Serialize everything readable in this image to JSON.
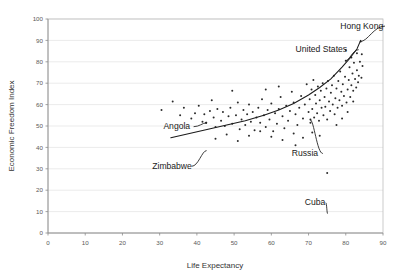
{
  "chart_data": {
    "type": "scatter",
    "title": "",
    "xlabel": "Life Expectancy",
    "ylabel": "Economic Freedom Index",
    "xlim": [
      0,
      90
    ],
    "ylim": [
      0,
      100
    ],
    "xticks": [
      0,
      10,
      20,
      30,
      40,
      50,
      60,
      70,
      80,
      90
    ],
    "yticks": [
      0,
      10,
      20,
      30,
      40,
      50,
      60,
      70,
      80,
      90,
      100
    ],
    "grid": true,
    "legend": null,
    "point_color": "#2b2b2b",
    "curve_color": "#1a1a1a",
    "grid_color": "#e2e2e2",
    "trend": {
      "label": "fitted exponential trend curve",
      "x": [
        33,
        38,
        43,
        48,
        53,
        58,
        62,
        66,
        70,
        73,
        76,
        79,
        81,
        83,
        84
      ],
      "y": [
        44.5,
        46.5,
        48.5,
        50.5,
        52.5,
        55,
        57.5,
        60.5,
        64.5,
        68,
        72,
        77.5,
        81.5,
        86,
        90
      ]
    },
    "annotations": [
      {
        "text": "Hong Kong",
        "x": 78.5,
        "y": 95.5,
        "leader_to_x": 84.0,
        "leader_to_y": 89.5
      },
      {
        "text": "United States",
        "x": 66.5,
        "y": 84.5,
        "leader_to_x": 80.0,
        "leader_to_y": 80.5
      },
      {
        "text": "Angola",
        "x": 31.0,
        "y": 48.5,
        "leader_to_x": 42.5,
        "leader_to_y": 51.5
      },
      {
        "text": "Russia",
        "x": 65.5,
        "y": 36.0,
        "leader_to_x": 70.5,
        "leader_to_y": 53.0
      },
      {
        "text": "Zimbabwe",
        "x": 28.0,
        "y": 30.0,
        "leader_to_x": 42.5,
        "leader_to_y": 38.5
      },
      {
        "text": "Cuba",
        "x": 69.0,
        "y": 13.0,
        "leader_to_x": 75.0,
        "leader_to_y": 9.0
      }
    ],
    "points": [
      [
        30.5,
        57.5
      ],
      [
        33.5,
        61.5
      ],
      [
        35.5,
        55.0
      ],
      [
        36.5,
        58.5
      ],
      [
        38.5,
        53.5
      ],
      [
        39.5,
        56.0
      ],
      [
        40.5,
        59.5
      ],
      [
        41.5,
        52.0
      ],
      [
        42.0,
        55.5
      ],
      [
        42.5,
        51.5
      ],
      [
        43.5,
        57.0
      ],
      [
        44.5,
        54.0
      ],
      [
        45.0,
        49.5
      ],
      [
        45.5,
        58.0
      ],
      [
        46.5,
        52.5
      ],
      [
        47.0,
        56.5
      ],
      [
        47.5,
        50.0
      ],
      [
        48.5,
        54.5
      ],
      [
        49.0,
        58.5
      ],
      [
        49.5,
        51.0
      ],
      [
        50.5,
        55.0
      ],
      [
        51.0,
        61.0
      ],
      [
        51.5,
        48.5
      ],
      [
        52.0,
        53.0
      ],
      [
        52.5,
        57.5
      ],
      [
        53.0,
        50.5
      ],
      [
        53.5,
        55.5
      ],
      [
        54.0,
        60.0
      ],
      [
        54.5,
        52.0
      ],
      [
        55.0,
        56.5
      ],
      [
        55.5,
        48.0
      ],
      [
        56.0,
        54.0
      ],
      [
        56.5,
        58.5
      ],
      [
        57.0,
        51.5
      ],
      [
        57.5,
        62.5
      ],
      [
        58.0,
        55.0
      ],
      [
        58.5,
        49.5
      ],
      [
        59.0,
        57.5
      ],
      [
        59.5,
        53.0
      ],
      [
        60.0,
        60.5
      ],
      [
        60.5,
        47.5
      ],
      [
        61.0,
        56.0
      ],
      [
        61.5,
        51.0
      ],
      [
        62.0,
        58.0
      ],
      [
        62.5,
        63.5
      ],
      [
        63.0,
        54.5
      ],
      [
        63.5,
        49.0
      ],
      [
        64.0,
        59.5
      ],
      [
        64.5,
        52.5
      ],
      [
        65.0,
        57.0
      ],
      [
        65.5,
        66.0
      ],
      [
        66.0,
        61.0
      ],
      [
        66.5,
        55.5
      ],
      [
        67.0,
        50.5
      ],
      [
        67.5,
        58.5
      ],
      [
        68.0,
        64.0
      ],
      [
        68.5,
        53.5
      ],
      [
        69.0,
        60.0
      ],
      [
        69.5,
        69.5
      ],
      [
        70.0,
        56.5
      ],
      [
        70.3,
        62.5
      ],
      [
        70.5,
        51.5
      ],
      [
        70.8,
        67.0
      ],
      [
        71.0,
        58.0
      ],
      [
        71.3,
        71.5
      ],
      [
        71.5,
        54.0
      ],
      [
        71.8,
        64.5
      ],
      [
        72.0,
        60.5
      ],
      [
        72.3,
        56.0
      ],
      [
        72.5,
        68.5
      ],
      [
        72.8,
        52.5
      ],
      [
        73.0,
        62.0
      ],
      [
        73.3,
        66.5
      ],
      [
        73.5,
        58.5
      ],
      [
        73.8,
        70.0
      ],
      [
        74.0,
        55.0
      ],
      [
        74.3,
        63.5
      ],
      [
        74.5,
        59.0
      ],
      [
        74.8,
        67.5
      ],
      [
        75.0,
        53.0
      ],
      [
        75.2,
        71.0
      ],
      [
        75.5,
        61.5
      ],
      [
        75.8,
        57.0
      ],
      [
        76.0,
        65.5
      ],
      [
        76.3,
        69.0
      ],
      [
        76.5,
        60.0
      ],
      [
        76.8,
        73.5
      ],
      [
        77.0,
        55.5
      ],
      [
        77.2,
        63.0
      ],
      [
        77.5,
        67.5
      ],
      [
        77.8,
        58.5
      ],
      [
        78.0,
        71.0
      ],
      [
        78.3,
        62.0
      ],
      [
        78.5,
        75.5
      ],
      [
        78.8,
        66.0
      ],
      [
        79.0,
        59.5
      ],
      [
        79.2,
        69.5
      ],
      [
        79.5,
        64.0
      ],
      [
        79.8,
        73.0
      ],
      [
        80.0,
        80.5
      ],
      [
        80.2,
        61.0
      ],
      [
        80.5,
        67.0
      ],
      [
        80.8,
        71.5
      ],
      [
        81.0,
        77.5
      ],
      [
        81.2,
        63.5
      ],
      [
        81.5,
        69.0
      ],
      [
        81.8,
        74.5
      ],
      [
        82.0,
        66.5
      ],
      [
        82.2,
        79.5
      ],
      [
        82.5,
        72.0
      ],
      [
        82.8,
        68.0
      ],
      [
        83.0,
        76.0
      ],
      [
        83.3,
        70.5
      ],
      [
        83.5,
        73.5
      ],
      [
        83.8,
        80.0
      ],
      [
        84.0,
        89.5
      ],
      [
        84.2,
        72.5
      ],
      [
        82.0,
        61.5
      ],
      [
        80.5,
        56.5
      ],
      [
        79.0,
        53.5
      ],
      [
        77.5,
        50.5
      ],
      [
        75.0,
        28.0
      ],
      [
        73.0,
        45.5
      ],
      [
        71.0,
        47.0
      ],
      [
        68.5,
        44.5
      ],
      [
        66.0,
        46.5
      ],
      [
        63.0,
        43.5
      ],
      [
        60.0,
        45.0
      ],
      [
        57.0,
        47.5
      ],
      [
        54.0,
        45.5
      ],
      [
        51.0,
        43.0
      ],
      [
        48.0,
        46.0
      ],
      [
        45.0,
        44.0
      ],
      [
        42.5,
        51.5
      ],
      [
        70.5,
        53.0
      ],
      [
        66.5,
        41.0
      ],
      [
        62.0,
        68.5
      ],
      [
        58.5,
        67.0
      ],
      [
        49.5,
        66.5
      ],
      [
        44.0,
        62.0
      ],
      [
        84.5,
        78.0
      ],
      [
        84.3,
        83.5
      ],
      [
        83.0,
        84.0
      ],
      [
        81.5,
        82.0
      ],
      [
        80.0,
        85.5
      ]
    ]
  }
}
